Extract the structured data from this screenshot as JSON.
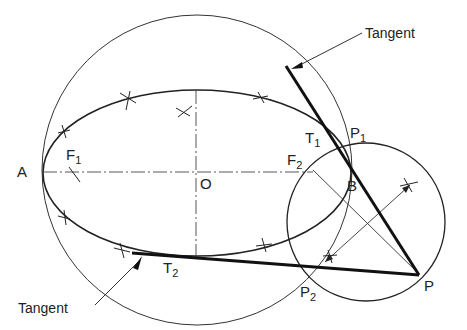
{
  "diagram": {
    "callouts": {
      "top": "Tangent",
      "bottom": "Tangent"
    },
    "points": {
      "A": "A",
      "O": "O",
      "B": "B",
      "F1": {
        "main": "F",
        "sub": "1"
      },
      "F2": {
        "main": "F",
        "sub": "2"
      },
      "T1": {
        "main": "T",
        "sub": "1"
      },
      "T2": {
        "main": "T",
        "sub": "2"
      },
      "P1": {
        "main": "P",
        "sub": "1"
      },
      "P2": {
        "main": "P",
        "sub": "2"
      },
      "P": "P"
    },
    "colors": {
      "ink": "#222222",
      "background": "#ffffff"
    }
  }
}
